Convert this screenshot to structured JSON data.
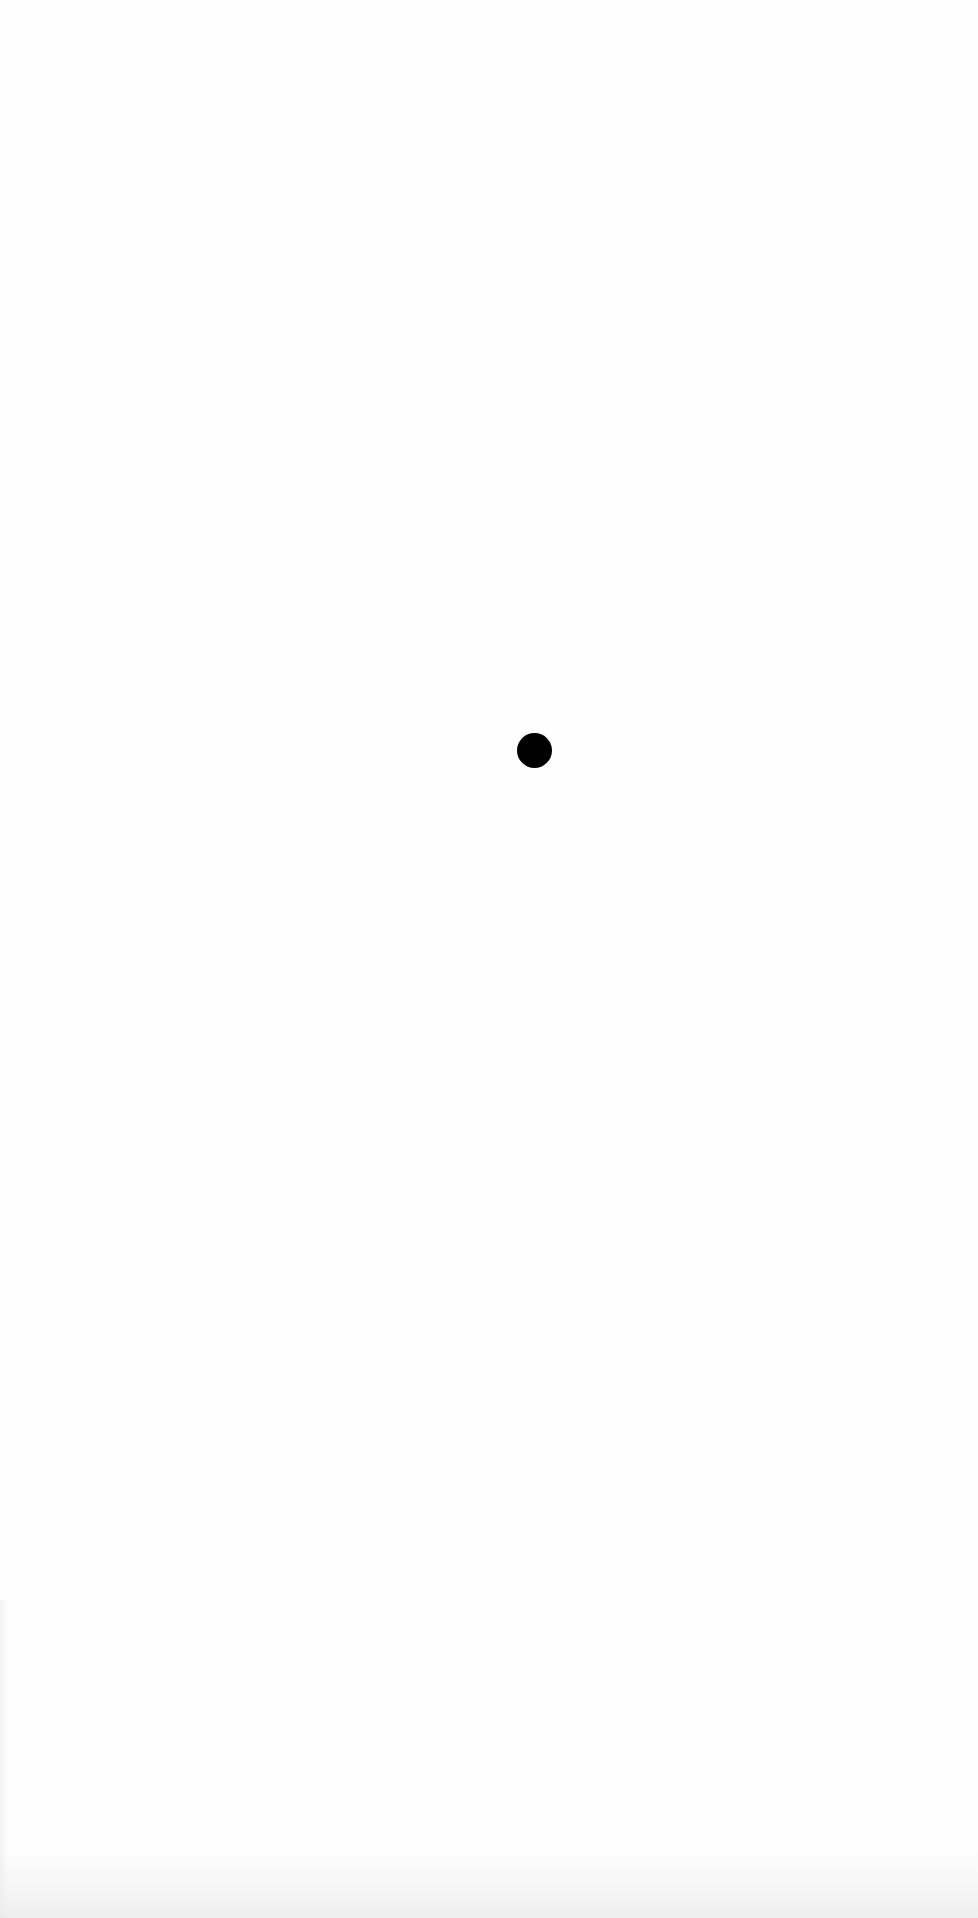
{
  "canvas": {
    "width": 978,
    "height": 1918,
    "background_color": "#fefefe"
  },
  "dot": {
    "shape": "circle",
    "color": "#000000",
    "center_x": 534,
    "center_y": 750,
    "diameter": 35
  },
  "artifacts": {
    "bottom_noise_color": "#e8e8e8"
  }
}
